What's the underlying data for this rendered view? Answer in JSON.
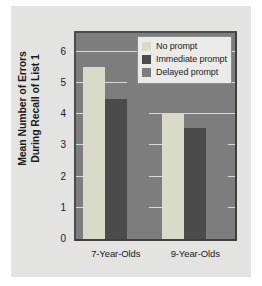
{
  "chart_data": {
    "type": "bar",
    "title": "",
    "xlabel": "",
    "ylabel_line1": "Mean Number of Errors",
    "ylabel_line2": "During Recall of List 1",
    "categories": [
      "7-Year-Olds",
      "9-Year-Olds"
    ],
    "series": [
      {
        "name": "No prompt",
        "values": [
          5.5,
          4.0
        ],
        "color": "#d9dbc8"
      },
      {
        "name": "Immediate prompt",
        "values": [
          4.5,
          3.55
        ],
        "color": "#4b4b4b"
      },
      {
        "name": "Delayed prompt",
        "values": [
          5.4,
          3.3
        ],
        "color": "#7d7d7d"
      }
    ],
    "ylim": [
      0,
      6.6
    ],
    "yticks": [
      0,
      1,
      2,
      3,
      4,
      5,
      6
    ],
    "ytick_labels": [
      "0",
      "1",
      "2",
      "3",
      "4",
      "5",
      "6"
    ],
    "grid": true,
    "gridlines_at": [
      1,
      2,
      3,
      4,
      5,
      6
    ],
    "legend_position": "top-right",
    "plot_background": "#7d7d7d",
    "figure_background": "#e3e3e1",
    "gridline_color": "#d8d8d4",
    "axis_color": "#3f3f3f"
  }
}
